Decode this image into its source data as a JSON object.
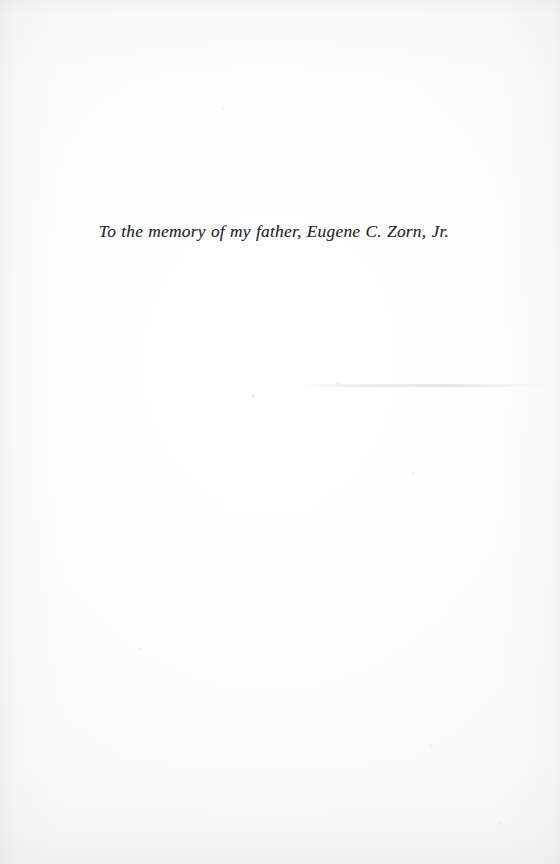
{
  "page": {
    "kind": "book-dedication-page",
    "paper_color": "#fdfdfd",
    "ink_color": "#2b2b2e"
  },
  "dedication": {
    "text": "To the memory of my father, Eugene C. Zorn, Jr."
  }
}
